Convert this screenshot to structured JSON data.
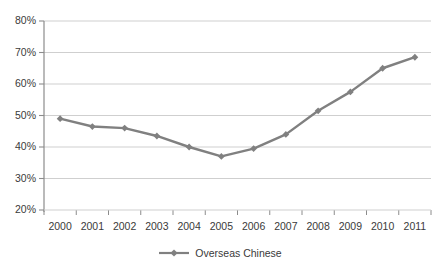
{
  "chart_data": {
    "type": "line",
    "title": "",
    "subtitle": "",
    "xlabel": "",
    "ylabel": "",
    "categories": [
      "2000",
      "2001",
      "2002",
      "2003",
      "2004",
      "2005",
      "2006",
      "2007",
      "2008",
      "2009",
      "2010",
      "2011"
    ],
    "series": [
      {
        "name": "Overseas Chinese",
        "values": [
          49,
          46.5,
          46,
          43.5,
          40,
          37,
          39.5,
          44,
          51.5,
          57.5,
          65,
          68.5
        ],
        "color": "#808080",
        "marker": "diamond"
      }
    ],
    "ylim": [
      20,
      80
    ],
    "ytick_values": [
      20,
      30,
      40,
      50,
      60,
      70,
      80
    ],
    "ytick_labels": [
      "20%",
      "30%",
      "40%",
      "50%",
      "60%",
      "70%",
      "80%"
    ],
    "xtick_labels": [
      "2000",
      "2001",
      "2002",
      "2003",
      "2004",
      "2005",
      "2006",
      "2007",
      "2008",
      "2009",
      "2010",
      "2011"
    ],
    "grid": "horizontal",
    "legend_position": "bottom",
    "legend_entries": [
      "Overseas Chinese"
    ],
    "annotations": []
  },
  "style": {
    "background": "#ffffff",
    "gridline_color": "#cfcfcf",
    "axis_color": "#8c8c8c",
    "tick_text_color": "#3a3a3a",
    "series_color": "#808080"
  },
  "geometry": {
    "plot_left": 44,
    "plot_right": 431,
    "plot_top": 21,
    "plot_bottom": 210
  }
}
